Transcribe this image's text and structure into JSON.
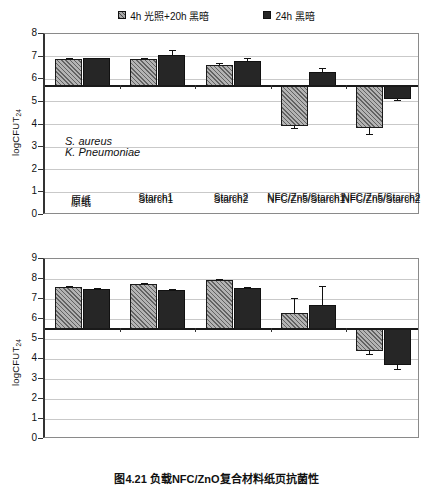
{
  "figure": {
    "caption": "图4.21   负载NFC/ZnO复合材料纸页抗菌性",
    "y_axis_title_main": "logCFUT",
    "y_axis_title_sub": "24"
  },
  "legend": {
    "position": "top-center",
    "items": [
      {
        "label": "4h 光照+20h 黑暗",
        "swatch": "hatched-gray",
        "color": "#a9a9a9"
      },
      {
        "label": "24h 黑暗",
        "swatch": "solid-black",
        "color": "#262626"
      }
    ]
  },
  "chart_data": [
    {
      "id": "s-aureus",
      "type": "bar",
      "title": "",
      "annotation": "S. aureus",
      "xlabel": "",
      "ylabel": "logCFUT24",
      "ylim": [
        0,
        8
      ],
      "yticks": [
        0,
        1,
        2,
        3,
        4,
        5,
        6,
        7,
        8
      ],
      "grid": true,
      "baseline": 5.7,
      "categories": [
        "原纸",
        "Starch1",
        "Starch2",
        "NFC/Zn5/Starch1",
        "NFC/Zn5/Starch2"
      ],
      "series": [
        {
          "name": "4h 光照+20h 黑暗",
          "values": [
            6.88,
            6.88,
            6.62,
            3.92,
            3.86
          ],
          "errors": [
            0.06,
            0.05,
            0.12,
            0.07,
            0.28
          ]
        },
        {
          "name": "24h 黑暗",
          "values": [
            6.92,
            7.08,
            6.8,
            6.32,
            5.12
          ],
          "errors": [
            0.04,
            0.22,
            0.12,
            0.18,
            0.05
          ]
        }
      ]
    },
    {
      "id": "k-pneumoniae",
      "type": "bar",
      "title": "",
      "annotation": "K. Pneumoniae",
      "xlabel": "",
      "ylabel": "logCFUT24",
      "ylim": [
        0,
        9
      ],
      "yticks": [
        0,
        1,
        2,
        3,
        4,
        5,
        6,
        7,
        8,
        9
      ],
      "grid": true,
      "baseline": 5.48,
      "categories": [
        "原纸",
        "Starch1",
        "Starch2",
        "NFC/Zn5/Starch1",
        "NFC/Zn5/Starch2"
      ],
      "series": [
        {
          "name": "4h 光照+20h 黑暗",
          "values": [
            7.58,
            7.75,
            7.95,
            6.28,
            4.4
          ],
          "errors": [
            0.06,
            0.06,
            0.05,
            0.78,
            0.14
          ]
        },
        {
          "name": "24h 黑暗",
          "values": [
            7.48,
            7.46,
            7.55,
            6.68,
            3.68
          ],
          "errors": [
            0.05,
            0.04,
            0.06,
            0.95,
            0.2
          ]
        }
      ]
    }
  ]
}
